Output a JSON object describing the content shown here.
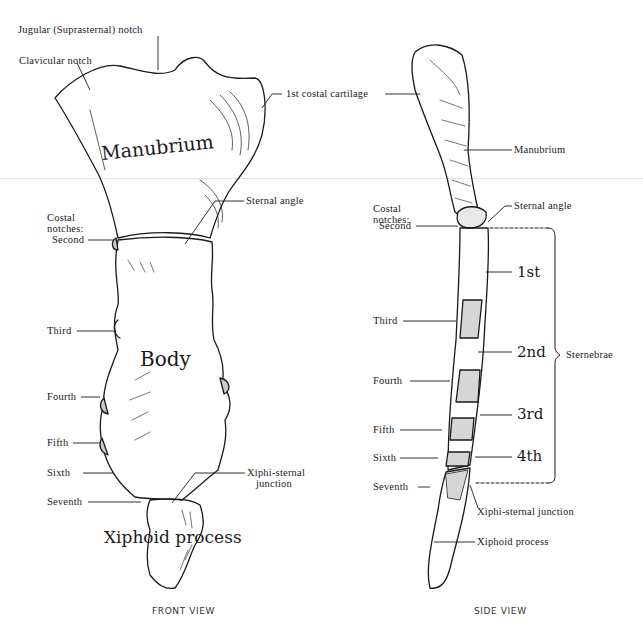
{
  "front_view": {
    "caption": "FRONT VIEW",
    "labels": {
      "jugular_notch": "Jugular (Suprasternal) notch",
      "clavicular_notch": "Clavicular notch",
      "first_costal_cartilage": "1st costal cartilage",
      "sternal_angle": "Sternal angle",
      "costal_notches_line1": "Costal",
      "costal_notches_line2": "notches:",
      "second": "Second",
      "third": "Third",
      "fourth": "Fourth",
      "fifth": "Fifth",
      "sixth": "Sixth",
      "seventh": "Seventh",
      "xiphisternal_line1": "Xiphi-sternal",
      "xiphisternal_line2": "junction"
    },
    "region_titles": {
      "manubrium": "Manubrium",
      "body": "Body",
      "xiphoid": "Xiphoid process"
    }
  },
  "side_view": {
    "caption": "SIDE VIEW",
    "labels": {
      "manubrium": "Manubrium",
      "sternal_angle": "Sternal angle",
      "costal_notches_line1": "Costal",
      "costal_notches_line2": "notches:",
      "second": "Second",
      "third": "Third",
      "fourth": "Fourth",
      "fifth": "Fifth",
      "sixth": "Sixth",
      "seventh": "Seventh",
      "xiphisternal": "Xiphi-sternal junction",
      "xiphoid": "Xiphoid process",
      "sternebrae": "Sternebrae"
    },
    "sternebrae": [
      "1st",
      "2nd",
      "3rd",
      "4th"
    ]
  },
  "colors": {
    "ink": "#1a1a1a",
    "shade": "#c8c8c8",
    "background": "#ffffff"
  }
}
